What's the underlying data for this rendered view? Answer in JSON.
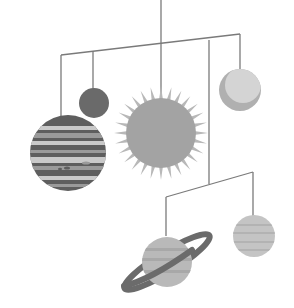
{
  "illustration": {
    "title": "Solar system hanging mobile",
    "colors": {
      "background": "#ffffff",
      "wire": "#7a7a7a",
      "sun": "#a3a3a3",
      "sun_rays": "#b8b8b8",
      "small_dark_planet": "#6a6a6a",
      "light_planet": "#d4d4d4",
      "light_planet_shade": "#b0b0b0",
      "banded_planet_dark": "#5e5e5e",
      "banded_planet_light": "#c9c9c9",
      "banded_planet_mid": "#9a9a9a",
      "ringed_planet": "#b9b9b9",
      "ring": "#6b6b6b",
      "striped_planet": "#c4c4c4"
    },
    "objects": [
      "sun",
      "small-dark-planet",
      "light-planet",
      "banded-planet",
      "ringed-planet",
      "striped-planet"
    ]
  }
}
